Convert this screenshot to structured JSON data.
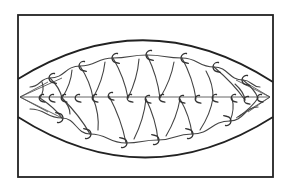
{
  "diagram": {
    "type": "knot-weave",
    "colors": {
      "background": "#ffffff",
      "ink": "#222222",
      "strand": "#444444"
    },
    "frame": {
      "x": 18,
      "y": 15,
      "width": 255,
      "height": 162
    },
    "lens": {
      "left_tip": [
        20,
        97
      ],
      "right_tip": [
        270,
        97
      ],
      "top_arc": {
        "start": [
          18,
          79
        ],
        "control": [
          145,
          0
        ],
        "end": [
          273,
          82
        ]
      },
      "bottom_arc": {
        "start": [
          18,
          117
        ],
        "control": [
          145,
          198
        ],
        "end": [
          273,
          117
        ]
      }
    },
    "rows": [
      {
        "name": "upper-row",
        "hooks": [
          [
            50,
            78
          ],
          [
            80,
            66
          ],
          [
            113,
            58
          ],
          [
            147,
            55
          ],
          [
            182,
            58
          ],
          [
            214,
            67
          ],
          [
            243,
            80
          ]
        ]
      },
      {
        "name": "middle-row",
        "hooks": [
          [
            40,
            98
          ],
          [
            50,
            98
          ],
          [
            62,
            98
          ],
          [
            76,
            98
          ],
          [
            93,
            98
          ],
          [
            109,
            96
          ],
          [
            128,
            98
          ],
          [
            146,
            99
          ],
          [
            160,
            98
          ],
          [
            180,
            99
          ],
          [
            196,
            99
          ],
          [
            213,
            98
          ],
          [
            232,
            98
          ],
          [
            245,
            100
          ],
          [
            258,
            98
          ]
        ]
      },
      {
        "name": "lower-row",
        "hooks": [
          [
            62,
            118
          ],
          [
            90,
            134
          ],
          [
            126,
            143
          ],
          [
            158,
            140
          ],
          [
            192,
            134
          ],
          [
            230,
            121
          ]
        ]
      }
    ]
  }
}
